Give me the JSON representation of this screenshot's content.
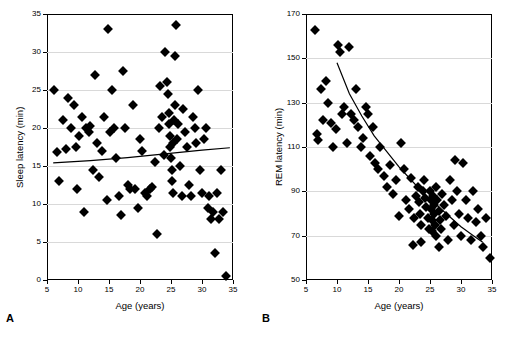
{
  "panels": [
    {
      "letter": "A",
      "xlabel": "Age (years)",
      "ylabel": "Sleep latency (min)"
    },
    {
      "letter": "B",
      "xlabel": "Age (years)",
      "ylabel": "REM latency (min)"
    }
  ],
  "chart_data": [
    {
      "type": "scatter",
      "panel": "A",
      "title": "",
      "xlabel": "Age (years)",
      "ylabel": "Sleep latency (min)",
      "xlim": [
        5,
        35
      ],
      "ylim": [
        0,
        35
      ],
      "xticks": [
        5,
        10,
        15,
        20,
        25,
        30,
        35
      ],
      "yticks": [
        0,
        5,
        10,
        15,
        20,
        25,
        30,
        35
      ],
      "grid": true,
      "legend": "none",
      "marker": "filled-diamond",
      "points": [
        [
          6.2,
          25.0
        ],
        [
          6.6,
          16.8
        ],
        [
          7.0,
          13.0
        ],
        [
          7.6,
          21.0
        ],
        [
          8.1,
          17.2
        ],
        [
          8.4,
          24.0
        ],
        [
          8.8,
          20.0
        ],
        [
          9.3,
          23.0
        ],
        [
          9.6,
          17.5
        ],
        [
          9.9,
          12.0
        ],
        [
          10.2,
          19.0
        ],
        [
          10.6,
          21.5
        ],
        [
          11.0,
          9.0
        ],
        [
          11.3,
          20.0
        ],
        [
          11.8,
          19.5
        ],
        [
          12.0,
          20.2
        ],
        [
          12.4,
          14.5
        ],
        [
          12.7,
          27.0
        ],
        [
          13.1,
          18.0
        ],
        [
          13.4,
          13.5
        ],
        [
          13.8,
          17.0
        ],
        [
          14.2,
          21.5
        ],
        [
          14.6,
          10.5
        ],
        [
          14.9,
          33.0
        ],
        [
          15.2,
          19.5
        ],
        [
          15.5,
          25.0
        ],
        [
          15.8,
          20.0
        ],
        [
          16.2,
          16.0
        ],
        [
          16.6,
          11.0
        ],
        [
          16.9,
          8.5
        ],
        [
          17.2,
          27.5
        ],
        [
          17.6,
          20.0
        ],
        [
          18.0,
          12.5
        ],
        [
          18.4,
          12.0
        ],
        [
          18.8,
          23.0
        ],
        [
          19.2,
          12.0
        ],
        [
          19.6,
          9.5
        ],
        [
          20.0,
          18.5
        ],
        [
          20.4,
          17.0
        ],
        [
          20.8,
          11.5
        ],
        [
          21.2,
          11.0
        ],
        [
          21.6,
          12.0
        ],
        [
          22.0,
          12.2
        ],
        [
          22.4,
          15.5
        ],
        [
          22.8,
          6.0
        ],
        [
          23.0,
          20.0
        ],
        [
          23.3,
          25.5
        ],
        [
          23.6,
          21.5
        ],
        [
          23.9,
          16.5
        ],
        [
          24.1,
          30.0
        ],
        [
          24.3,
          26.0
        ],
        [
          24.5,
          24.5
        ],
        [
          24.6,
          22.0
        ],
        [
          24.7,
          20.5
        ],
        [
          24.8,
          19.0
        ],
        [
          24.9,
          17.5
        ],
        [
          25.0,
          16.0
        ],
        [
          25.1,
          14.5
        ],
        [
          25.2,
          13.0
        ],
        [
          25.3,
          11.5
        ],
        [
          25.4,
          18.0
        ],
        [
          25.5,
          21.0
        ],
        [
          25.6,
          23.0
        ],
        [
          25.7,
          29.5
        ],
        [
          25.8,
          33.5
        ],
        [
          26.0,
          18.5
        ],
        [
          26.2,
          20.5
        ],
        [
          26.5,
          15.0
        ],
        [
          26.8,
          11.0
        ],
        [
          27.0,
          22.5
        ],
        [
          27.3,
          19.5
        ],
        [
          27.6,
          17.5
        ],
        [
          27.9,
          12.5
        ],
        [
          28.2,
          11.0
        ],
        [
          28.5,
          21.5
        ],
        [
          28.8,
          20.0
        ],
        [
          29.1,
          18.0
        ],
        [
          29.4,
          25.0
        ],
        [
          29.7,
          14.5
        ],
        [
          30.0,
          11.5
        ],
        [
          30.3,
          18.5
        ],
        [
          30.6,
          20.0
        ],
        [
          30.9,
          9.5
        ],
        [
          31.2,
          11.0
        ],
        [
          31.5,
          8.0
        ],
        [
          31.8,
          9.0
        ],
        [
          32.1,
          3.5
        ],
        [
          32.4,
          11.5
        ],
        [
          32.7,
          8.0
        ],
        [
          33.0,
          14.5
        ],
        [
          33.4,
          9.0
        ],
        [
          33.8,
          0.5
        ]
      ],
      "fit_curve": [
        [
          6.0,
          15.4
        ],
        [
          12.0,
          15.7
        ],
        [
          18.0,
          16.1
        ],
        [
          24.0,
          16.6
        ],
        [
          30.0,
          17.1
        ],
        [
          34.5,
          17.4
        ]
      ]
    },
    {
      "type": "scatter",
      "panel": "B",
      "title": "",
      "xlabel": "Age (years)",
      "ylabel": "REM latency (min)",
      "xlim": [
        5,
        35
      ],
      "ylim": [
        50,
        170
      ],
      "xticks": [
        5,
        10,
        15,
        20,
        25,
        30,
        35
      ],
      "yticks": [
        50,
        70,
        90,
        110,
        130,
        150,
        170
      ],
      "grid": true,
      "legend": "none",
      "marker": "filled-diamond",
      "points": [
        [
          6.5,
          163.0
        ],
        [
          6.8,
          116.0
        ],
        [
          7.0,
          113.0
        ],
        [
          7.4,
          136.0
        ],
        [
          7.8,
          122.0
        ],
        [
          8.2,
          140.0
        ],
        [
          8.6,
          130.0
        ],
        [
          9.0,
          121.0
        ],
        [
          9.4,
          110.0
        ],
        [
          9.8,
          118.0
        ],
        [
          10.2,
          156.0
        ],
        [
          10.5,
          153.0
        ],
        [
          10.8,
          125.0
        ],
        [
          11.2,
          128.0
        ],
        [
          11.6,
          112.0
        ],
        [
          12.0,
          155.0
        ],
        [
          12.3,
          125.0
        ],
        [
          12.7,
          122.0
        ],
        [
          13.0,
          136.0
        ],
        [
          13.4,
          119.0
        ],
        [
          13.8,
          110.0
        ],
        [
          14.2,
          114.0
        ],
        [
          14.6,
          128.0
        ],
        [
          15.0,
          125.0
        ],
        [
          15.4,
          106.0
        ],
        [
          15.8,
          119.0
        ],
        [
          16.2,
          103.0
        ],
        [
          16.6,
          100.0
        ],
        [
          17.0,
          110.0
        ],
        [
          17.5,
          97.0
        ],
        [
          18.0,
          92.0
        ],
        [
          18.5,
          102.0
        ],
        [
          19.0,
          89.0
        ],
        [
          19.5,
          95.0
        ],
        [
          20.0,
          79.0
        ],
        [
          20.4,
          112.0
        ],
        [
          20.8,
          100.0
        ],
        [
          21.2,
          86.0
        ],
        [
          21.6,
          82.0
        ],
        [
          22.0,
          96.0
        ],
        [
          22.4,
          78.0
        ],
        [
          22.8,
          88.0
        ],
        [
          23.0,
          92.0
        ],
        [
          23.2,
          85.0
        ],
        [
          23.4,
          80.0
        ],
        [
          23.6,
          75.0
        ],
        [
          23.8,
          90.0
        ],
        [
          24.0,
          95.0
        ],
        [
          24.2,
          87.0
        ],
        [
          24.4,
          83.0
        ],
        [
          24.6,
          78.0
        ],
        [
          24.8,
          73.0
        ],
        [
          25.0,
          90.0
        ],
        [
          25.1,
          86.0
        ],
        [
          25.2,
          82.0
        ],
        [
          25.3,
          77.0
        ],
        [
          25.4,
          72.0
        ],
        [
          25.5,
          88.0
        ],
        [
          25.6,
          84.0
        ],
        [
          25.7,
          80.0
        ],
        [
          25.8,
          75.0
        ],
        [
          25.9,
          70.0
        ],
        [
          26.0,
          92.0
        ],
        [
          26.2,
          86.0
        ],
        [
          26.4,
          81.0
        ],
        [
          26.6,
          77.0
        ],
        [
          26.8,
          73.0
        ],
        [
          27.0,
          89.0
        ],
        [
          27.3,
          84.0
        ],
        [
          27.6,
          79.0
        ],
        [
          27.9,
          68.0
        ],
        [
          28.2,
          95.0
        ],
        [
          28.5,
          86.0
        ],
        [
          28.8,
          75.0
        ],
        [
          29.1,
          104.0
        ],
        [
          29.4,
          90.0
        ],
        [
          29.7,
          80.0
        ],
        [
          30.0,
          70.0
        ],
        [
          30.4,
          103.0
        ],
        [
          30.8,
          86.0
        ],
        [
          31.2,
          78.0
        ],
        [
          31.6,
          68.0
        ],
        [
          32.0,
          90.0
        ],
        [
          32.4,
          76.0
        ],
        [
          32.8,
          82.0
        ],
        [
          33.2,
          70.0
        ],
        [
          33.6,
          65.0
        ],
        [
          34.0,
          78.0
        ],
        [
          34.6,
          60.0
        ],
        [
          22.2,
          66.0
        ],
        [
          23.5,
          67.0
        ],
        [
          26.5,
          65.0
        ]
      ],
      "fit_curve": [
        [
          10.0,
          148.0
        ],
        [
          12.0,
          134.0
        ],
        [
          14.0,
          124.0
        ],
        [
          16.0,
          115.0
        ],
        [
          18.0,
          108.0
        ],
        [
          20.0,
          101.0
        ],
        [
          22.0,
          95.0
        ],
        [
          24.0,
          89.0
        ],
        [
          26.0,
          84.0
        ],
        [
          28.0,
          79.0
        ],
        [
          30.0,
          74.0
        ],
        [
          32.0,
          70.0
        ],
        [
          33.5,
          67.0
        ]
      ]
    }
  ]
}
